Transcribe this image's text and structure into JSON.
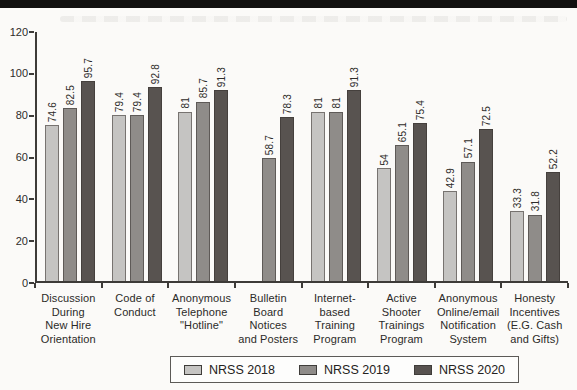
{
  "page": {
    "top_bar_color": "#121110",
    "background": "#fbfaf8",
    "axis_color": "#3d3b38"
  },
  "chart_data": {
    "type": "bar",
    "title": "",
    "xlabel": "",
    "ylabel": "",
    "ylim": [
      0,
      120
    ],
    "yticks": [
      0,
      20,
      40,
      60,
      80,
      100,
      120
    ],
    "grid": false,
    "legend_position": "bottom",
    "categories": [
      "Discussion During New Hire Orientation",
      "Code of Conduct",
      "Anonymous Telephone \"Hotline\"",
      "Bulletin Board Notices and Posters",
      "Internet-based Training Program",
      "Active Shooter Trainings Program",
      "Anonymous Online/email Notification System",
      "Honesty Incentives (E.G. Cash and Gifts)"
    ],
    "category_lines": [
      [
        "Discussion",
        "During",
        "New Hire",
        "Orientation"
      ],
      [
        "Code of",
        "Conduct"
      ],
      [
        "Anonymous",
        "Telephone",
        "\"Hotline\""
      ],
      [
        "Bulletin",
        "Board",
        "Notices",
        "and Posters"
      ],
      [
        "Internet-",
        "based",
        "Training",
        "Program"
      ],
      [
        "Active",
        "Shooter",
        "Trainings",
        "Program"
      ],
      [
        "Anonymous",
        "Online/email",
        "Notification",
        "System"
      ],
      [
        "Honesty",
        "Incentives",
        "(E.G. Cash",
        "and Gifts)"
      ]
    ],
    "series": [
      {
        "name": "NRSS 2018",
        "color": "#c5c4c2",
        "values": [
          74.6,
          79.4,
          81,
          null,
          81,
          54,
          42.9,
          33.3
        ],
        "labels": [
          "74.6",
          "79.4",
          "81",
          null,
          "81",
          "54",
          "42.9",
          "33.3"
        ]
      },
      {
        "name": "NRSS 2019",
        "color": "#8f8c89",
        "values": [
          82.5,
          79.4,
          85.7,
          58.7,
          81,
          65.1,
          57.1,
          31.8
        ],
        "labels": [
          "82.5",
          "79.4",
          "85.7",
          "58.7",
          "81",
          "65.1",
          "57.1",
          "31.8"
        ]
      },
      {
        "name": "NRSS 2020",
        "color": "#585350",
        "values": [
          95.7,
          92.8,
          91.3,
          78.3,
          91.3,
          75.4,
          72.5,
          52.2
        ],
        "labels": [
          "95.7",
          "92.8",
          "91.3",
          "78.3",
          "91.3",
          "75.4",
          "72.5",
          "52.2"
        ]
      }
    ]
  }
}
